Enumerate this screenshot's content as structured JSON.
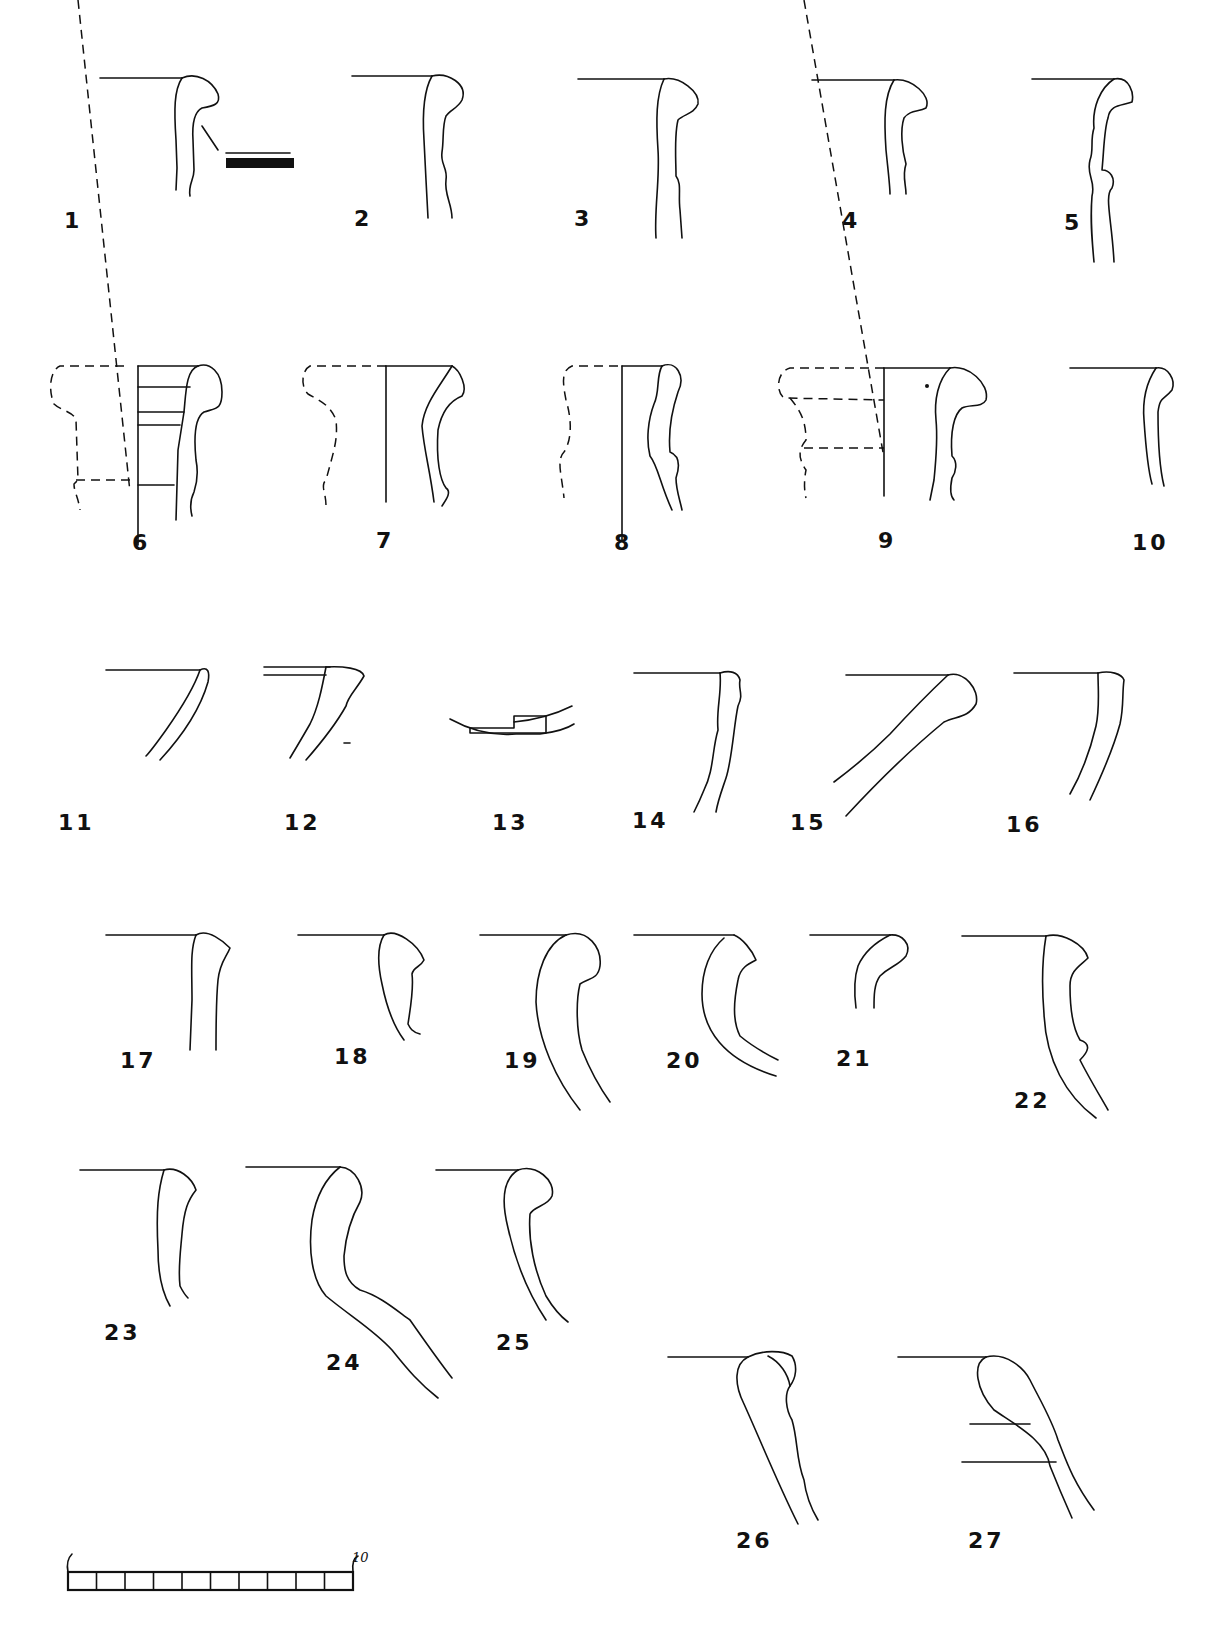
{
  "plate": {
    "type": "pottery rim profile drawings",
    "figures": [
      {
        "id": 1,
        "label": "1",
        "note": "rim profile with decoration detail (horizontal bands)"
      },
      {
        "id": 2,
        "label": "2"
      },
      {
        "id": 3,
        "label": "3"
      },
      {
        "id": 4,
        "label": "4"
      },
      {
        "id": 5,
        "label": "5"
      },
      {
        "id": 6,
        "label": "6",
        "note": "reconstructed profile with dashed outline"
      },
      {
        "id": 7,
        "label": "7",
        "note": "reconstructed profile with dashed outline"
      },
      {
        "id": 8,
        "label": "8",
        "note": "reconstructed profile with dashed outline"
      },
      {
        "id": 9,
        "label": "9",
        "note": "reconstructed profile with dashed outline"
      },
      {
        "id": 10,
        "label": "10"
      },
      {
        "id": 11,
        "label": "11"
      },
      {
        "id": 12,
        "label": "12"
      },
      {
        "id": 13,
        "label": "13",
        "note": "base fragment"
      },
      {
        "id": 14,
        "label": "14"
      },
      {
        "id": 15,
        "label": "15"
      },
      {
        "id": 16,
        "label": "16"
      },
      {
        "id": 17,
        "label": "17"
      },
      {
        "id": 18,
        "label": "18"
      },
      {
        "id": 19,
        "label": "19"
      },
      {
        "id": 20,
        "label": "20"
      },
      {
        "id": 21,
        "label": "21"
      },
      {
        "id": 22,
        "label": "22"
      },
      {
        "id": 23,
        "label": "23"
      },
      {
        "id": 24,
        "label": "24"
      },
      {
        "id": 25,
        "label": "25"
      },
      {
        "id": 26,
        "label": "26"
      },
      {
        "id": 27,
        "label": "27"
      }
    ],
    "scale_bar": {
      "segments": 10,
      "start_label": "",
      "end_label": "10"
    }
  }
}
